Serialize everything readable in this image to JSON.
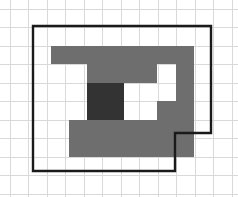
{
  "figure": {
    "canvas": {
      "width": 238,
      "height": 197,
      "background": "#ffffff"
    },
    "grid": {
      "cell_size": 18.5,
      "origin_x": 10,
      "origin_y": 9,
      "columns": 12,
      "rows": 10,
      "line_color": "#d9d9d9",
      "visible": true
    },
    "colors": {
      "grid": "#d9d9d9",
      "outline": "#1a1a1a",
      "band": "#6e6e6e",
      "core": "#333333",
      "interior": "#f7f7f7",
      "background": "#ffffff"
    },
    "shapes": {
      "outline": {
        "name": "notched-rectangle-outline",
        "stroke_color": "#1a1a1a",
        "stroke_width": 2.4,
        "fill": "#f7f7f7",
        "points": "33,26 211,26 211,133 175,133 175,171 33,171",
        "closed": true,
        "cells_wide": 9.6,
        "cells_tall": 7.8
      },
      "band": {
        "name": "spiral-band",
        "fill": "#6e6e6e",
        "thickness_cells": 1,
        "points": "51,46 194,46 194,157 69,157 69,120 157,120 157,83 124,83 124,101 87,101 87,64 176,64 176,101 157,101 157,64 51,64",
        "description": "gray C-shaped spiral band one cell thick"
      },
      "core": {
        "name": "center-square",
        "fill": "#333333",
        "x": 87,
        "y": 83,
        "width": 37,
        "height": 37,
        "cells": 2
      }
    }
  }
}
